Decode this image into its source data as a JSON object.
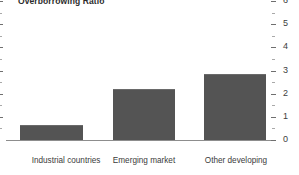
{
  "chart_data": {
    "type": "bar",
    "title": "Overborrowing Ratio",
    "xlabel": "",
    "ylabel": "",
    "categories": [
      "Industrial countries",
      "Emerging market economies",
      "Other developing countries"
    ],
    "category_lines": [
      [
        "Industrial countries"
      ],
      [
        "Emerging market",
        "economies"
      ],
      [
        "Other developing",
        "countries"
      ]
    ],
    "values": [
      0.65,
      2.2,
      2.85
    ],
    "ylim": [
      0,
      6
    ],
    "yaxis_position": "right",
    "ytick_labels": [
      "0",
      "1",
      "2",
      "3",
      "4",
      "5",
      "6"
    ],
    "ytick_values": [
      0,
      1,
      2,
      3,
      4,
      5,
      6
    ],
    "minor_ticks": true,
    "minor_tick_values": [
      0.5,
      1.5,
      2.5,
      3.5,
      4.5,
      5.5
    ],
    "grid": false,
    "legend": null,
    "bar_color": "#545454",
    "axis_color": "#8d8d8d",
    "background": "#ffffff"
  },
  "axis": {
    "label_0": "0",
    "label_1": "1",
    "label_2": "2",
    "label_3": "3",
    "label_4": "4",
    "label_5": "5",
    "label_6": "6"
  },
  "categories": {
    "c0_line0": "Industrial countries",
    "c1_line0": "Emerging market",
    "c1_line1": "economies",
    "c2_line0": "Other developing",
    "c2_line1": "countries"
  }
}
